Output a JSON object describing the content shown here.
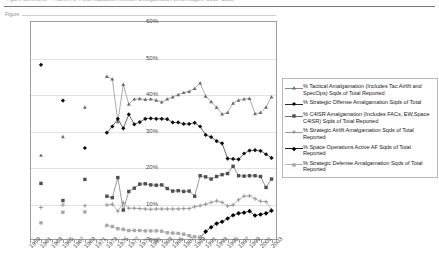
{
  "page": {
    "top_clipped_text": "Figure continued — Active Air Force squadron mission amalgamation percentages, 1959–2003",
    "caption_fragment": "Figure"
  },
  "chart_data": {
    "type": "line",
    "title": "",
    "xlabel": "",
    "ylabel": "",
    "ylim": [
      0,
      60
    ],
    "y_ticks": [
      "0%",
      "10%",
      "20%",
      "30%",
      "40%",
      "50%",
      "60%"
    ],
    "y_tick_values": [
      0,
      10,
      20,
      30,
      40,
      50,
      60
    ],
    "grid": true,
    "legend_position": "right",
    "x_range": [
      1959,
      2004
    ],
    "x_tick_labels": [
      "1959",
      "1961",
      "1963",
      "1965",
      "1967",
      "1969",
      "1971",
      "1973",
      "1975",
      "1977",
      "1979",
      "1981",
      "1983",
      "1985",
      "1987",
      "1989",
      "1991",
      "1993",
      "1995",
      "1997",
      "1999",
      "2001",
      "2003"
    ],
    "x_tick_values": [
      1959,
      1961,
      1963,
      1965,
      1967,
      1969,
      1971,
      1973,
      1975,
      1977,
      1979,
      1981,
      1983,
      1985,
      1987,
      1989,
      1991,
      1993,
      1995,
      1997,
      1999,
      2001,
      2003
    ],
    "series": [
      {
        "name": "% Tactical Amalgamation (Includes Tac Airlift and SpecOps) Sqds of Total Reported",
        "marker": "triangle",
        "x": [
          1961,
          1965,
          1969,
          1973,
          1974,
          1975,
          1976,
          1977,
          1978,
          1979,
          1980,
          1981,
          1982,
          1983,
          1984,
          1985,
          1986,
          1987,
          1988,
          1989,
          1990,
          1991,
          1992,
          1993,
          1994,
          1995,
          1996,
          1997,
          1998,
          1999,
          2000,
          2001,
          2002,
          2003
        ],
        "values": [
          23.2,
          28.3,
          36.4,
          44.8,
          44.1,
          32.4,
          42.6,
          37.2,
          38.6,
          38.7,
          38.5,
          38.6,
          38.3,
          37.8,
          38.6,
          39.2,
          39.8,
          40.4,
          40.7,
          41.5,
          43.0,
          39.4,
          37.9,
          36.3,
          34.5,
          34.9,
          37.5,
          38.3,
          38.6,
          38.8,
          34.6,
          34.9,
          36.4,
          39.2
        ]
      },
      {
        "name": "% Strategic Offense Amalgamation Sqds of Total",
        "marker": "diamond",
        "x": [
          1961,
          1965,
          1969,
          1973,
          1974,
          1975,
          1976,
          1977,
          1978,
          1979,
          1980,
          1981,
          1982,
          1983,
          1984,
          1985,
          1986,
          1987,
          1988,
          1989,
          1990,
          1991,
          1992,
          1993,
          1994,
          1995,
          1996,
          1997,
          1998,
          1999,
          2000,
          2001,
          2002,
          2003
        ],
        "values": [
          48.0,
          38.2,
          25.2,
          29.4,
          31.1,
          33.2,
          30.6,
          34.4,
          31.7,
          32.3,
          33.2,
          33.3,
          33.2,
          33.2,
          33.1,
          32.2,
          32.2,
          31.8,
          31.8,
          32.1,
          31.1,
          28.8,
          28.2,
          27.1,
          26.5,
          22.3,
          22.2,
          22.1,
          23.7,
          24.5,
          24.6,
          24.4,
          23.5,
          22.5
        ]
      },
      {
        "name": "% C4ISR Amalgamation (Includes FACs, EW,Space C4ISR) Sqds of Total Reported",
        "marker": "square",
        "x": [
          1961,
          1965,
          1969,
          1973,
          1974,
          1975,
          1976,
          1977,
          1978,
          1979,
          1980,
          1981,
          1982,
          1983,
          1984,
          1985,
          1986,
          1987,
          1988,
          1989,
          1990,
          1991,
          1992,
          1993,
          1994,
          1995,
          1996,
          1997,
          1998,
          1999,
          2000,
          2001,
          2002,
          2003
        ],
        "values": [
          15.5,
          10.8,
          16.6,
          12.0,
          11.6,
          17.1,
          8.2,
          13.3,
          14.2,
          15.3,
          15.4,
          15.1,
          15.0,
          15.1,
          14.1,
          13.4,
          13.5,
          13.3,
          13.4,
          12.0,
          17.6,
          17.3,
          16.7,
          17.4,
          17.9,
          18.2,
          20.2,
          17.6,
          17.5,
          17.6,
          17.6,
          17.4,
          14.4,
          16.7
        ]
      },
      {
        "name": "% Strategic Airlift Amalgamation Sqds of Total Reported",
        "marker": "plus",
        "x": [
          1961,
          1965,
          1969,
          1973,
          1974,
          1975,
          1976,
          1977,
          1978,
          1979,
          1980,
          1981,
          1982,
          1983,
          1984,
          1985,
          1986,
          1987,
          1988,
          1989,
          1990,
          1991,
          1992,
          1993,
          1994,
          1995,
          1996,
          1997,
          1998,
          1999,
          2000,
          2001,
          2002,
          2003
        ],
        "values": [
          8.9,
          9.6,
          9.4,
          9.6,
          9.8,
          7.9,
          10.2,
          8.7,
          8.7,
          8.6,
          8.5,
          8.4,
          8.5,
          8.5,
          8.5,
          8.5,
          8.5,
          8.6,
          8.6,
          9.1,
          9.4,
          9.8,
          10.3,
          10.7,
          10.3,
          9.3,
          9.6,
          11.0,
          12.0,
          12.1,
          11.3,
          10.6,
          10.5,
          8.2
        ]
      },
      {
        "name": "% Space Operations Active AF Sqds of Total Reported",
        "marker": "diamond-filled",
        "x": [
          1990,
          1991,
          1992,
          1993,
          1994,
          1995,
          1996,
          1997,
          1998,
          1999,
          2000,
          2001,
          2002,
          2003
        ],
        "values": [
          0.7,
          2.3,
          3.5,
          4.5,
          5.0,
          5.9,
          6.8,
          7.3,
          7.5,
          7.9,
          6.7,
          7.0,
          7.3,
          8.0
        ]
      },
      {
        "name": "% Strategic Defense Amalgamation Sqds of Total Reported",
        "marker": "square-gray",
        "x": [
          1961,
          1965,
          1969,
          1973,
          1974,
          1975,
          1976,
          1977,
          1978,
          1979,
          1980,
          1981,
          1982,
          1983,
          1984,
          1985,
          1986,
          1987,
          1988,
          1989,
          1990
        ],
        "values": [
          4.7,
          7.6,
          7.7,
          4.0,
          3.7,
          3.1,
          2.9,
          2.6,
          2.6,
          2.6,
          2.5,
          2.5,
          2.5,
          2.4,
          2.0,
          1.9,
          1.8,
          1.6,
          1.2,
          0.9,
          0.7
        ]
      }
    ]
  },
  "legend": {
    "items": [
      {
        "label": "% Tactical Amalgamation (Includes Tac Airlift and SpecOps) Sqds of Total Reported",
        "marker": "triangle"
      },
      {
        "label": "% Strategic Offense Amalgamation Sqds of Total",
        "marker": "diamond"
      },
      {
        "label": "% C4ISR Amalgamation (Includes FACs, EW,Space C4ISR) Sqds of Total Reported",
        "marker": "square"
      },
      {
        "label": "% Strategic Airlift Amalgamation Sqds of Total Reported",
        "marker": "plus"
      },
      {
        "label": "% Space Operations Active AF Sqds of Total Reported",
        "marker": "diamond-filled"
      },
      {
        "label": "% Strategic Defense Amalgamation Sqds of Total Reported",
        "marker": "square-gray"
      }
    ]
  },
  "colors": {
    "axis": "#9d9d9d",
    "grid": "#e3e3e3",
    "series_dark": "#1a1a1a",
    "series_mid": "#5e5e5e",
    "series_light": "#9a9a9a",
    "text": "#4a4a4a"
  }
}
